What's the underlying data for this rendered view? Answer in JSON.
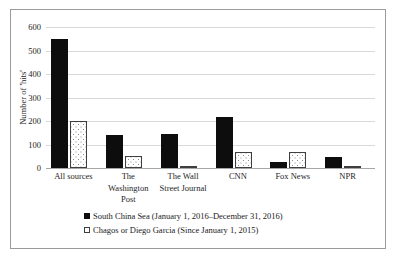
{
  "chart_data": {
    "type": "bar",
    "title": "",
    "xlabel": "",
    "ylabel": "Number of 'hits'",
    "ylim": [
      0,
      600
    ],
    "yticks": [
      0,
      100,
      200,
      300,
      400,
      500,
      600
    ],
    "ytick_labels": [
      "0",
      "100",
      "200",
      "300",
      "400",
      "500",
      "600"
    ],
    "grid": true,
    "legend_position": "bottom",
    "categories": [
      "All sources",
      "The Washington Post",
      "The Wall Street Journal",
      "CNN",
      "Fox News",
      "NPR"
    ],
    "category_lines": [
      [
        "All sources"
      ],
      [
        "The",
        "Washington",
        "Post"
      ],
      [
        "The Wall",
        "Street Journal"
      ],
      [
        "CNN"
      ],
      [
        "Fox News"
      ],
      [
        "NPR"
      ]
    ],
    "series": [
      {
        "name": "South China Sea (January 1, 2016–December 31, 2016)",
        "style": "solid-black",
        "color": "#0d0d0d",
        "values": [
          550,
          140,
          145,
          215,
          25,
          45
        ]
      },
      {
        "name": "Chagos or Diego Garcia (Since January 1, 2015)",
        "style": "dotted-white",
        "color": "#ffffff",
        "values": [
          200,
          50,
          5,
          70,
          70,
          5
        ]
      }
    ]
  },
  "legend": {
    "items": [
      {
        "swatch": "black-square",
        "label": "South China Sea (January 1, 2016–December 31, 2016)"
      },
      {
        "swatch": "dotted-square",
        "label": "Chagos or Diego Garcia (Since January 1, 2015)"
      }
    ]
  }
}
